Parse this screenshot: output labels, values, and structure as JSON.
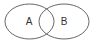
{
  "diagram": {
    "type": "venn",
    "sets": [
      {
        "label": "A",
        "cx": 29.5,
        "cy": 21.5,
        "rx": 24.5,
        "ry": 17.5
      },
      {
        "label": "B",
        "cx": 64,
        "cy": 21.5,
        "rx": 25,
        "ry": 17.5
      }
    ],
    "stroke_color": "#555555",
    "text_color": "#333333",
    "background": "#ffffff"
  }
}
